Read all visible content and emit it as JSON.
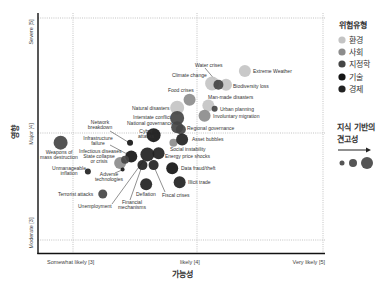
{
  "chart_data": {
    "type": "scatter",
    "title": "",
    "xlabel": "가능성",
    "ylabel": "영향",
    "xlim": [
      2.72,
      5.02
    ],
    "ylim": [
      2.87,
      5.04
    ],
    "grid": "dotted lines at tick values",
    "x_ticks": [
      {
        "value": 3,
        "label": "Somewhat likely [3]"
      },
      {
        "value": 4,
        "label": "likely [4]"
      },
      {
        "value": 5,
        "label": "Very likely [5]"
      }
    ],
    "y_ticks": [
      {
        "value": 5,
        "label": "Severe [5]"
      },
      {
        "value": 4,
        "label": "Major [4]"
      },
      {
        "value": 3,
        "label": "Moderate [3]"
      }
    ],
    "legend": {
      "title": "위험유형",
      "position": "right",
      "entries": [
        {
          "label": "환경",
          "color": "#c4c4c4"
        },
        {
          "label": "사회",
          "color": "#8c8c8c"
        },
        {
          "label": "지정학",
          "color": "#454545"
        },
        {
          "label": "기술",
          "color": "#151515"
        },
        {
          "label": "경제",
          "color": "#222222"
        }
      ]
    },
    "size_legend": {
      "title_line1": "지식 기반의",
      "title_line2": "견고성",
      "sizes": [
        2.5,
        4,
        6
      ]
    },
    "points": [
      {
        "name": "Extreme Weather",
        "category": "환경",
        "x": 4.38,
        "y": 4.54,
        "size": 6,
        "label": [
          "Extreme Weather"
        ],
        "label_at": [
          253,
          73
        ],
        "anchor": "start"
      },
      {
        "name": "Climate change",
        "category": "환경",
        "x": 4.12,
        "y": 4.43,
        "size": 7,
        "label": [
          "Climate change"
        ],
        "label_at": [
          172,
          77
        ],
        "anchor": "start"
      },
      {
        "name": "Biodiversity loss",
        "category": "환경",
        "x": 4.23,
        "y": 4.42,
        "size": 6,
        "label": [
          "Biodiversity loss"
        ],
        "label_at": [
          233,
          88
        ],
        "anchor": "start"
      },
      {
        "name": "Water crises",
        "category": "지정학",
        "x": 4.17,
        "y": 4.42,
        "size": 5,
        "label": [
          "Water crises"
        ],
        "label_at": [
          195,
          67
        ],
        "anchor": "start",
        "leader": [
          205,
          68,
          216,
          81
        ]
      },
      {
        "name": "Natural disasters",
        "category": "환경",
        "x": 3.84,
        "y": 4.22,
        "size": 7,
        "label": [
          "Natural disasters"
        ],
        "label_at": [
          132,
          110
        ],
        "anchor": "start"
      },
      {
        "name": "Man-made disasters",
        "category": "환경",
        "x": 4.09,
        "y": 4.24,
        "size": 6,
        "label": [
          "Man-made disasters"
        ],
        "label_at": [
          208,
          99
        ],
        "anchor": "start"
      },
      {
        "name": "Food crises",
        "category": "사회",
        "x": 3.94,
        "y": 4.29,
        "size": 6,
        "label": [
          "Food crises"
        ],
        "label_at": [
          168,
          92
        ],
        "anchor": "start"
      },
      {
        "name": "Involuntary migration",
        "category": "사회",
        "x": 4.06,
        "y": 4.15,
        "size": 6,
        "label": [
          "Involuntary migration"
        ],
        "label_at": [
          213,
          118
        ],
        "anchor": "start"
      },
      {
        "name": "Urban planning",
        "category": "지정학",
        "x": 4.14,
        "y": 4.21,
        "size": 3,
        "label": [
          "Urban planning"
        ],
        "label_at": [
          220,
          111
        ],
        "anchor": "start"
      },
      {
        "name": "Interstate conflict",
        "category": "지정학",
        "x": 3.84,
        "y": 4.13,
        "size": 7,
        "label": [
          "Interstate conflict"
        ],
        "label_at": [
          133,
          119
        ],
        "anchor": "start"
      },
      {
        "name": "National governance",
        "category": "지정학",
        "x": 3.84,
        "y": 4.05,
        "size": 6,
        "label": [
          "National governance"
        ],
        "label_at": [
          127,
          125
        ],
        "anchor": "start"
      },
      {
        "name": "Regional governance",
        "category": "지정학",
        "x": 3.87,
        "y": 4.03,
        "size": 5,
        "label": [
          "Regional governance"
        ],
        "label_at": [
          187,
          130
        ],
        "anchor": "start"
      },
      {
        "name": "Social instability",
        "category": "사회",
        "x": 3.81,
        "y": 3.91,
        "size": 4,
        "label": [
          "Social instability"
        ],
        "label_at": [
          170,
          151
        ],
        "anchor": "start"
      },
      {
        "name": "Asset bubbles",
        "category": "경제",
        "x": 3.88,
        "y": 3.94,
        "size": 6,
        "label": [
          "Asset bubbles"
        ],
        "label_at": [
          192,
          141
        ],
        "anchor": "start"
      },
      {
        "name": "Cyber attacks",
        "category": "기술",
        "x": 3.65,
        "y": 3.98,
        "size": 7,
        "label": [
          "Cyber",
          "attacks"
        ],
        "label_at": [
          146,
          133
        ],
        "anchor": "middle"
      },
      {
        "name": "Network breakdown",
        "category": "기술",
        "x": 3.46,
        "y": 3.91,
        "size": 3,
        "label": [
          "Network",
          "breakdown"
        ],
        "label_at": [
          100,
          124
        ],
        "anchor": "middle",
        "leader": [
          110,
          131,
          128,
          142
        ]
      },
      {
        "name": "Infrastructure failure",
        "category": "기술",
        "x": 3.47,
        "y": 3.78,
        "size": 6,
        "label": [
          "Infrastructure",
          "failure"
        ],
        "label_at": [
          98,
          140
        ],
        "anchor": "middle",
        "leader": [
          110,
          145,
          127,
          154
        ]
      },
      {
        "name": "Infectious diseases",
        "category": "사회",
        "x": 3.38,
        "y": 3.72,
        "size": 6,
        "label": [
          "Infectious diseases"
        ],
        "label_at": [
          79,
          153
        ],
        "anchor": "start"
      },
      {
        "name": "State collapse or crisis",
        "category": "지정학",
        "x": 3.42,
        "y": 3.75,
        "size": 4,
        "label": [
          "State collapse",
          "or crisis"
        ],
        "label_at": [
          99,
          158
        ],
        "anchor": "middle"
      },
      {
        "name": "Adverse technologies",
        "category": "기술",
        "x": 3.4,
        "y": 3.66,
        "size": 2,
        "label": [
          "Adverse",
          "technologies"
        ],
        "label_at": [
          109,
          176
        ],
        "anchor": "middle",
        "leader": [
          115,
          173,
          122,
          170
        ]
      },
      {
        "name": "Weapons of mass destruction",
        "category": "지정학",
        "x": 2.9,
        "y": 3.91,
        "size": 7,
        "label": [
          "Weapons of",
          "mass destruction"
        ],
        "label_at": [
          59,
          154
        ],
        "anchor": "middle"
      },
      {
        "name": "Unmanageable inflation",
        "category": "경제",
        "x": 3.12,
        "y": 3.64,
        "size": 3,
        "label": [
          "Unmanageable",
          "inflation"
        ],
        "label_at": [
          69,
          170
        ],
        "anchor": "middle"
      },
      {
        "name": "Terrorist attacks",
        "category": "지정학",
        "x": 3.24,
        "y": 3.43,
        "size": 4.5,
        "label": [
          "Terrorist attacks"
        ],
        "label_at": [
          58,
          196
        ],
        "anchor": "start"
      },
      {
        "name": "Unemployment",
        "category": "경제",
        "x": 3.6,
        "y": 3.8,
        "size": 7,
        "label": [
          "Unemployment"
        ],
        "label_at": [
          78,
          208
        ],
        "anchor": "start",
        "leader": [
          112,
          204,
          144,
          160
        ]
      },
      {
        "name": "Energy price shocks",
        "category": "경제",
        "x": 3.69,
        "y": 3.81,
        "size": 6,
        "label": [
          "Energy price shocks"
        ],
        "label_at": [
          165,
          158
        ],
        "anchor": "start"
      },
      {
        "name": "Financial mechanisms",
        "category": "경제",
        "x": 3.56,
        "y": 3.7,
        "size": 5,
        "label": [
          "Financial",
          "mechanisms"
        ],
        "label_at": [
          132,
          204
        ],
        "anchor": "middle",
        "leader": [
          130,
          200,
          141,
          169
        ]
      },
      {
        "name": "Fiscal crises",
        "category": "경제",
        "x": 3.65,
        "y": 3.7,
        "size": 5,
        "label": [
          "Fiscal crises"
        ],
        "label_at": [
          162,
          197
        ],
        "anchor": "start",
        "leader": [
          165,
          192,
          155,
          169
        ]
      },
      {
        "name": "Deflation",
        "category": "경제",
        "x": 3.59,
        "y": 3.52,
        "size": 6,
        "label": [
          "Deflation"
        ],
        "label_at": [
          136,
          196
        ],
        "anchor": "start"
      },
      {
        "name": "Data fraud/theft",
        "category": "기술",
        "x": 3.8,
        "y": 3.67,
        "size": 6,
        "label": [
          "Data fraud/theft"
        ],
        "label_at": [
          181,
          170
        ],
        "anchor": "start"
      },
      {
        "name": "Illicit trade",
        "category": "경제",
        "x": 3.86,
        "y": 3.54,
        "size": 6,
        "label": [
          "Illicit trade"
        ],
        "label_at": [
          188,
          184
        ],
        "anchor": "start"
      }
    ]
  }
}
